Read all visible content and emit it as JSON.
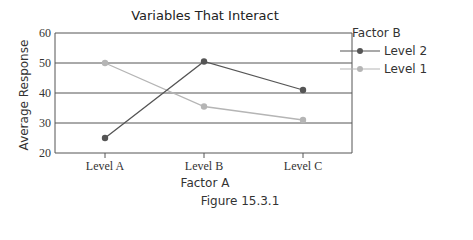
{
  "chart_data": {
    "type": "line",
    "title": "Variables That Interact",
    "xlabel": "Factor A",
    "ylabel": "Average Response",
    "categories": [
      "Level A",
      "Level B",
      "Level C"
    ],
    "series": [
      {
        "name": "Level 2",
        "values": [
          25,
          50.5,
          41
        ],
        "color": "#555555"
      },
      {
        "name": "Level 1",
        "values": [
          50,
          35.5,
          31
        ],
        "color": "#b5b5b5"
      }
    ],
    "ylim": [
      20,
      60
    ],
    "yticks": [
      20,
      30,
      40,
      50,
      60
    ],
    "grid": true,
    "legend_title": "Factor B",
    "legend_position": "right"
  },
  "caption": "Figure 15.3.1"
}
